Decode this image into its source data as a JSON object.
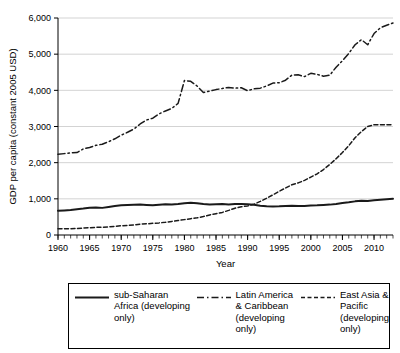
{
  "chart_data": {
    "type": "line",
    "title": "",
    "xlabel": "Year",
    "ylabel": "GDP per capita (constant 2005 USD)",
    "xlim": [
      1960,
      2013
    ],
    "ylim": [
      0,
      6000
    ],
    "grid": true,
    "grid_axis": "y",
    "legend_position": "below",
    "y_ticks": [
      0,
      1000,
      2000,
      3000,
      4000,
      5000,
      6000
    ],
    "y_tick_labels": [
      "0",
      "1,000",
      "2,000",
      "3,000",
      "4,000",
      "5,000",
      "6,000"
    ],
    "x_ticks": [
      1960,
      1965,
      1970,
      1975,
      1980,
      1985,
      1990,
      1995,
      2000,
      2005,
      2010
    ],
    "x_tick_labels": [
      "1960",
      "1965",
      "1970",
      "1975",
      "1980",
      "1985",
      "1990",
      "1995",
      "2000",
      "2005",
      "2010"
    ],
    "x_minor_tick_interval": 1,
    "x": [
      1960,
      1961,
      1962,
      1963,
      1964,
      1965,
      1966,
      1967,
      1968,
      1969,
      1970,
      1971,
      1972,
      1973,
      1974,
      1975,
      1976,
      1977,
      1978,
      1979,
      1980,
      1981,
      1982,
      1983,
      1984,
      1985,
      1986,
      1987,
      1988,
      1989,
      1990,
      1991,
      1992,
      1993,
      1994,
      1995,
      1996,
      1997,
      1998,
      1999,
      2000,
      2001,
      2002,
      2003,
      2004,
      2005,
      2006,
      2007,
      2008,
      2009,
      2010,
      2011,
      2012,
      2013
    ],
    "series": [
      {
        "name": "sub-Saharan Africa (developing only)",
        "line_style": "solid",
        "color": "#1a1a1a",
        "values": [
          670,
          680,
          690,
          715,
          730,
          755,
          760,
          750,
          775,
          800,
          820,
          830,
          835,
          840,
          830,
          820,
          835,
          850,
          845,
          855,
          880,
          890,
          880,
          855,
          845,
          850,
          855,
          845,
          855,
          860,
          850,
          835,
          810,
          795,
          790,
          795,
          805,
          810,
          805,
          805,
          815,
          820,
          830,
          840,
          860,
          885,
          905,
          930,
          950,
          940,
          960,
          975,
          990,
          1000
        ]
      },
      {
        "name": "Latin America & Caribbean (developing only)",
        "line_style": "dashdot",
        "color": "#1a1a1a",
        "values": [
          2230,
          2250,
          2270,
          2280,
          2380,
          2420,
          2480,
          2510,
          2580,
          2660,
          2760,
          2840,
          2930,
          3070,
          3180,
          3230,
          3350,
          3430,
          3500,
          3640,
          4270,
          4250,
          4120,
          3940,
          3980,
          4020,
          4050,
          4080,
          4060,
          4070,
          3990,
          4040,
          4060,
          4120,
          4200,
          4210,
          4280,
          4420,
          4430,
          4380,
          4470,
          4440,
          4390,
          4420,
          4640,
          4820,
          5020,
          5260,
          5400,
          5260,
          5570,
          5730,
          5800,
          5860
        ]
      },
      {
        "name": "East Asia & Pacific (developing only)",
        "line_style": "dashed",
        "color": "#1a1a1a",
        "values": [
          175,
          170,
          172,
          180,
          192,
          200,
          212,
          215,
          225,
          240,
          255,
          265,
          278,
          300,
          310,
          322,
          335,
          352,
          375,
          400,
          425,
          450,
          475,
          510,
          555,
          590,
          625,
          680,
          740,
          780,
          805,
          850,
          930,
          1015,
          1110,
          1210,
          1300,
          1390,
          1440,
          1510,
          1600,
          1690,
          1810,
          1950,
          2110,
          2280,
          2470,
          2690,
          2860,
          3000,
          3050,
          3050,
          3050,
          3050
        ]
      }
    ]
  },
  "legend": {
    "entries": [
      {
        "label": "sub-Saharan Africa (developing only)",
        "style": "solid"
      },
      {
        "label": "Latin America & Caribbean (developing only)",
        "style": "dashdot"
      },
      {
        "label": "East Asia & Pacific (developing only)",
        "style": "dashed"
      }
    ]
  }
}
